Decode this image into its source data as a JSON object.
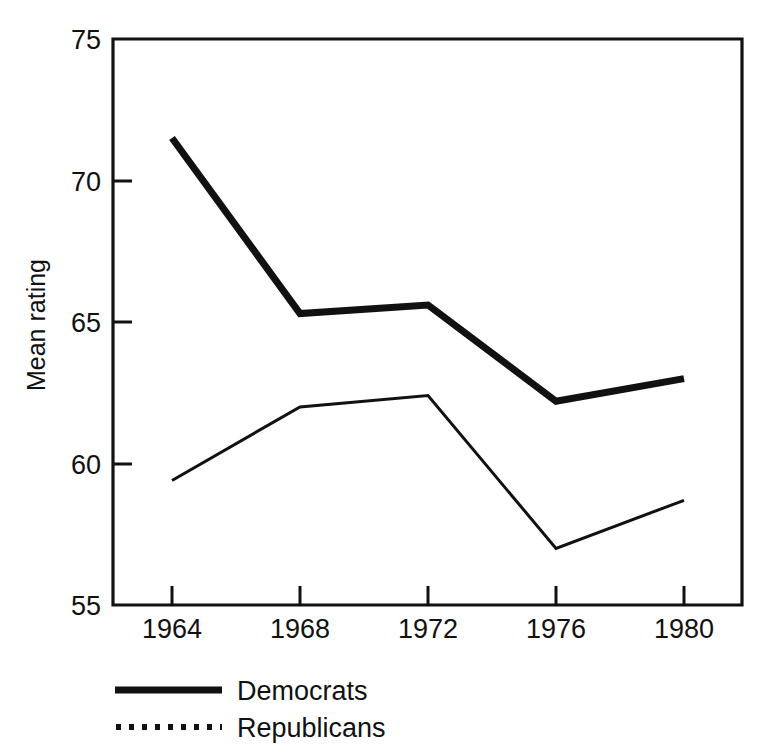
{
  "chart_data": {
    "type": "line",
    "title": "",
    "xlabel": "",
    "ylabel": "Mean rating",
    "categories": [
      "1964",
      "1968",
      "1972",
      "1976",
      "1980"
    ],
    "x": [
      1964,
      1968,
      1972,
      1976,
      1980
    ],
    "xlim": [
      1962,
      1982
    ],
    "ylim": [
      55,
      75
    ],
    "yticks": [
      55,
      60,
      65,
      70,
      75
    ],
    "ytick_labels": [
      "55",
      "60",
      "65",
      "70",
      "75"
    ],
    "xtick_labels": [
      "1964",
      "1968",
      "1972",
      "1976",
      "1980"
    ],
    "grid": false,
    "legend_position": "below-left",
    "series": [
      {
        "name": "Democrats",
        "style": "thick-solid",
        "values": [
          71.5,
          65.3,
          65.6,
          62.2,
          63.0
        ]
      },
      {
        "name": "Republicans",
        "style": "thin-solid",
        "values": [
          59.4,
          62.0,
          62.4,
          57.0,
          58.7
        ]
      }
    ]
  },
  "axes": {
    "y_title": "Mean rating",
    "y_tick_55": "55",
    "y_tick_60": "60",
    "y_tick_65": "65",
    "y_tick_70": "70",
    "y_tick_75": "75",
    "x_tick_1964": "1964",
    "x_tick_1968": "1968",
    "x_tick_1972": "1972",
    "x_tick_1976": "1976",
    "x_tick_1980": "1980"
  },
  "legend": {
    "entries": [
      {
        "label": "Democrats",
        "swatch": "solid-thick-line-icon"
      },
      {
        "label": "Republicans",
        "swatch": "dotted-line-icon"
      }
    ],
    "democrats_label": "Democrats",
    "republicans_label": "Republicans"
  },
  "colors": {
    "ink": "#111111",
    "background": "#ffffff"
  }
}
